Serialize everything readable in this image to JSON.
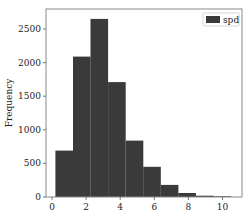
{
  "chart_data": {
    "type": "bar",
    "subtype": "histogram",
    "title": "",
    "xlabel": "",
    "ylabel": "Frequency",
    "legend": {
      "entries": [
        "spd"
      ],
      "position": "upper right"
    },
    "grid": false,
    "xlim": [
      -0.3,
      11.2
    ],
    "ylim": [
      0,
      2800
    ],
    "x_ticks": [
      0,
      2,
      4,
      6,
      8,
      10
    ],
    "y_ticks": [
      0,
      500,
      1000,
      1500,
      2000,
      2500
    ],
    "bin_edges": [
      0.2,
      1.23,
      2.26,
      3.29,
      4.32,
      5.35,
      6.38,
      7.41,
      8.44,
      9.47,
      10.5
    ],
    "series": [
      {
        "name": "spd",
        "color": "#3a3a3a",
        "values": [
          690,
          2090,
          2650,
          1710,
          840,
          450,
          180,
          60,
          20,
          10
        ]
      }
    ]
  },
  "colors": {
    "bar": "#3a3a3a",
    "frame": "#888888",
    "background": "#ffffff"
  }
}
